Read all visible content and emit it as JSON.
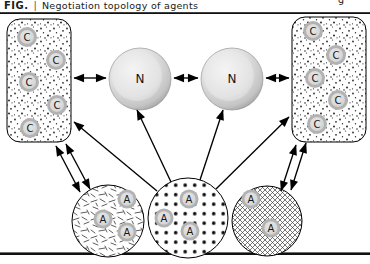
{
  "caption": {
    "figure_label": "FIG.",
    "separator": "|",
    "title": "Negotiation topology of agents",
    "right_fragment": "g"
  },
  "nodes": {
    "left_cluster": [
      "C",
      "C",
      "C",
      "C",
      "C"
    ],
    "right_cluster": [
      "C",
      "C",
      "C",
      "C",
      "C"
    ],
    "negotiators": [
      "N",
      "N"
    ],
    "left_agents": [
      "A",
      "A",
      "A"
    ],
    "center_agents": [
      "A",
      "A",
      "A"
    ],
    "right_agents": [
      "A",
      "A"
    ]
  },
  "textures": {
    "left_cluster": "stipple-dots",
    "right_cluster": "stipple-dots",
    "left_agents": "random-dashes",
    "center_agents": "polka-dots",
    "right_agents": "crosshatch"
  },
  "connections": [
    {
      "from": "left-cluster",
      "to": "negotiator-1",
      "type": "bidirectional"
    },
    {
      "from": "negotiator-1",
      "to": "negotiator-2",
      "type": "bidirectional"
    },
    {
      "from": "negotiator-2",
      "to": "right-cluster",
      "type": "bidirectional"
    },
    {
      "from": "center-agents",
      "to": "left-cluster",
      "type": "directed"
    },
    {
      "from": "center-agents",
      "to": "negotiator-1",
      "type": "directed"
    },
    {
      "from": "center-agents",
      "to": "negotiator-2",
      "type": "directed"
    },
    {
      "from": "center-agents",
      "to": "right-cluster",
      "type": "directed"
    },
    {
      "from": "left-agents",
      "to": "left-cluster",
      "type": "bidirectional-double"
    },
    {
      "from": "right-agents",
      "to": "right-cluster",
      "type": "bidirectional-double"
    }
  ],
  "colors": {
    "ink": "#000000",
    "node_ring": "#b2b2b2",
    "node_fill": "#dcdcdc",
    "sphere_edge": "#8f8f8f",
    "background": "#ffffff"
  }
}
